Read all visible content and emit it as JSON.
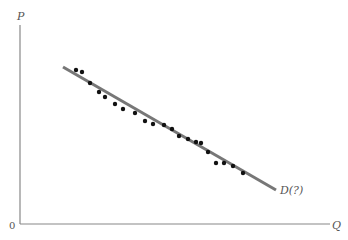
{
  "chart_data": {
    "type": "scatter",
    "title": "",
    "xlabel": "Q",
    "ylabel": "P",
    "origin_label": "0",
    "xlim": [
      0,
      310
    ],
    "ylim": [
      0,
      199
    ],
    "grid": false,
    "legend": null,
    "series": [
      {
        "name": "observations",
        "kind": "scatter",
        "color": "#111111",
        "points": [
          [
            56,
            154
          ],
          [
            62,
            152
          ],
          [
            70,
            141
          ],
          [
            79,
            132
          ],
          [
            85,
            127
          ],
          [
            95,
            120
          ],
          [
            103,
            115
          ],
          [
            115,
            111
          ],
          [
            125,
            103
          ],
          [
            133,
            100
          ],
          [
            144,
            99
          ],
          [
            152,
            95
          ],
          [
            159,
            88
          ],
          [
            168,
            85
          ],
          [
            176,
            82
          ],
          [
            181,
            81
          ],
          [
            188,
            72
          ],
          [
            196,
            61
          ],
          [
            204,
            61
          ],
          [
            213,
            58
          ],
          [
            223,
            51
          ]
        ]
      },
      {
        "name": "D(?)",
        "kind": "line",
        "color": "#777777",
        "points": [
          [
            43,
            157
          ],
          [
            256,
            34
          ]
        ]
      }
    ],
    "annotations": [
      {
        "text": "D(?)",
        "x": 260,
        "y": 32
      }
    ]
  },
  "labels": {
    "y_axis": "P",
    "x_axis": "Q",
    "origin": "0",
    "curve": "D(?)"
  }
}
